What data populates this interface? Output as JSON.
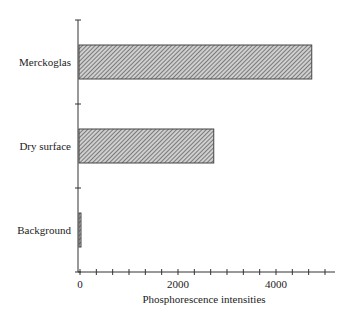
{
  "chart_data": {
    "type": "bar",
    "orientation": "horizontal",
    "title": "",
    "xlabel": "Phosphorescence intensities",
    "ylabel": "",
    "categories": [
      "Merckoglas",
      "Dry surface",
      "Background"
    ],
    "values": [
      4750,
      2750,
      40
    ],
    "xlim": [
      0,
      5000
    ],
    "xticks": [
      0,
      2000,
      4000
    ],
    "x_minor_tick_step": 333.33,
    "grid": false,
    "legend": null,
    "bar_fill": "diagonal-hatch",
    "colors": {
      "axis": "#333333",
      "bar_stroke": "#444444",
      "hatch": "#555555"
    }
  }
}
